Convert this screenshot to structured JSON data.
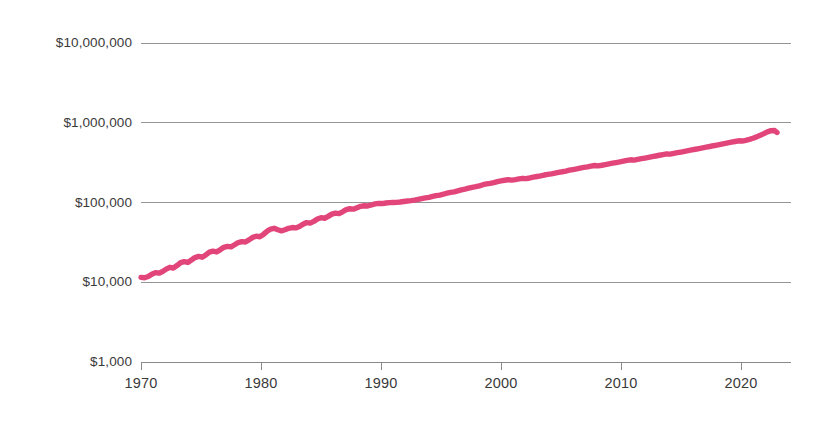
{
  "chart_data": {
    "type": "line",
    "title": "",
    "subtitle": "",
    "xlabel": "",
    "ylabel": "",
    "yscale": "log",
    "xlim": [
      1970,
      2023
    ],
    "ylim": [
      1000,
      10000000
    ],
    "grid": true,
    "legend": "none",
    "legend_entries": [],
    "annotations": [],
    "line_color": "#E2457A",
    "grid_color": "#8a8a8a",
    "axis_color": "#8a8a8a",
    "label_color": "#3a3a3a",
    "background_color": "#ffffff",
    "y_ticks": [
      1000,
      10000,
      100000,
      1000000,
      10000000
    ],
    "y_tick_labels": [
      "$1,000",
      "$10,000",
      "$100,000",
      "$1,000,000",
      "$10,000,000"
    ],
    "x_ticks": [
      1970,
      1980,
      1990,
      2000,
      2010,
      2020
    ],
    "x_tick_labels": [
      "1970",
      "1980",
      "1990",
      "2000",
      "2010",
      "2020"
    ],
    "series": [
      {
        "name": "value",
        "x": [
          1970.0,
          1970.3,
          1970.6,
          1970.9,
          1971.2,
          1971.5,
          1971.8,
          1972.1,
          1972.4,
          1972.7,
          1973.0,
          1973.3,
          1973.6,
          1973.9,
          1974.2,
          1974.5,
          1974.8,
          1975.1,
          1975.4,
          1975.7,
          1976.0,
          1976.3,
          1976.6,
          1976.9,
          1977.2,
          1977.5,
          1977.8,
          1978.1,
          1978.4,
          1978.7,
          1979.0,
          1979.3,
          1979.6,
          1979.9,
          1980.2,
          1980.5,
          1980.8,
          1981.1,
          1981.4,
          1981.7,
          1982.0,
          1982.3,
          1982.6,
          1982.9,
          1983.2,
          1983.5,
          1983.8,
          1984.1,
          1984.4,
          1984.7,
          1985.0,
          1985.3,
          1985.6,
          1985.9,
          1986.2,
          1986.5,
          1986.8,
          1987.1,
          1987.4,
          1987.7,
          1988.0,
          1988.3,
          1988.6,
          1988.9,
          1989.2,
          1989.5,
          1989.8,
          1990.1,
          1990.4,
          1990.7,
          1991.0,
          1991.3,
          1991.6,
          1991.9,
          1992.2,
          1992.5,
          1992.8,
          1993.1,
          1993.4,
          1993.7,
          1994.0,
          1994.3,
          1994.6,
          1994.9,
          1995.2,
          1995.5,
          1995.8,
          1996.1,
          1996.4,
          1996.7,
          1997.0,
          1997.3,
          1997.6,
          1997.9,
          1998.2,
          1998.5,
          1998.8,
          1999.1,
          1999.4,
          1999.7,
          2000.0,
          2000.3,
          2000.6,
          2000.9,
          2001.2,
          2001.5,
          2001.8,
          2002.1,
          2002.4,
          2002.7,
          2003.0,
          2003.3,
          2003.6,
          2003.9,
          2004.2,
          2004.5,
          2004.8,
          2005.1,
          2005.4,
          2005.7,
          2006.0,
          2006.3,
          2006.6,
          2006.9,
          2007.2,
          2007.5,
          2007.8,
          2008.1,
          2008.4,
          2008.7,
          2009.0,
          2009.3,
          2009.6,
          2009.9,
          2010.2,
          2010.5,
          2010.8,
          2011.1,
          2011.4,
          2011.7,
          2012.0,
          2012.3,
          2012.6,
          2012.9,
          2013.2,
          2013.5,
          2013.8,
          2014.1,
          2014.4,
          2014.7,
          2015.0,
          2015.3,
          2015.6,
          2015.9,
          2016.2,
          2016.5,
          2016.8,
          2017.1,
          2017.4,
          2017.7,
          2018.0,
          2018.3,
          2018.6,
          2018.9,
          2019.2,
          2019.5,
          2019.8,
          2020.1,
          2020.4,
          2020.7,
          2021.0,
          2021.3,
          2021.6,
          2021.9,
          2022.2,
          2022.5,
          2022.8,
          2023.0
        ],
        "y": [
          11500,
          11400,
          11800,
          12600,
          13200,
          13000,
          13600,
          14600,
          15400,
          15100,
          16200,
          17600,
          18100,
          17700,
          19000,
          20400,
          21100,
          20600,
          22000,
          23800,
          24500,
          24000,
          25500,
          27400,
          28200,
          27800,
          29500,
          31500,
          32300,
          32000,
          34000,
          36500,
          37800,
          37200,
          39800,
          43500,
          46500,
          47500,
          45500,
          44200,
          45500,
          47500,
          48500,
          48000,
          50000,
          53500,
          56000,
          55200,
          58000,
          62000,
          64500,
          63500,
          67000,
          71500,
          73500,
          72500,
          76500,
          81500,
          83500,
          82500,
          86000,
          89500,
          91000,
          90500,
          93000,
          96000,
          97500,
          97000,
          98500,
          99500,
          100000,
          100500,
          101500,
          103000,
          104500,
          105500,
          107000,
          109500,
          112000,
          114000,
          116000,
          119000,
          122000,
          124000,
          127000,
          131000,
          134000,
          136000,
          140000,
          144000,
          147000,
          151000,
          155000,
          158000,
          162000,
          167000,
          171000,
          174000,
          178000,
          183000,
          187000,
          190000,
          193000,
          191000,
          194000,
          198000,
          201000,
          199000,
          203000,
          208000,
          212000,
          216000,
          221000,
          225000,
          229000,
          234000,
          239000,
          243000,
          248000,
          254000,
          259000,
          264000,
          270000,
          275000,
          280000,
          286000,
          291000,
          288000,
          293000,
          299000,
          305000,
          311000,
          317000,
          323000,
          330000,
          337000,
          343000,
          340000,
          347000,
          354000,
          361000,
          368000,
          376000,
          383000,
          391000,
          399000,
          407000,
          404000,
          412000,
          421000,
          429000,
          438000,
          447000,
          456000,
          465000,
          475000,
          485000,
          494000,
          504000,
          515000,
          525000,
          536000,
          547000,
          558000,
          570000,
          582000,
          594000,
          590000,
          603000,
          620000,
          640000,
          665000,
          695000,
          730000,
          770000,
          795000,
          800000,
          755000
        ]
      }
    ]
  },
  "geometry": {
    "plot_left": 141,
    "plot_right": 791,
    "plot_top": 43,
    "plot_bottom": 362,
    "decade_px": 120,
    "decade_y_px": 79.75
  }
}
